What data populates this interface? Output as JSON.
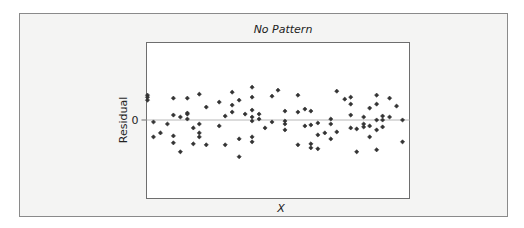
{
  "chart_data": {
    "type": "scatter",
    "title": "No Pattern",
    "xlabel": "X",
    "ylabel": "Residual",
    "y_ticks": [
      {
        "value": 0,
        "label": "0"
      }
    ],
    "x_ticks": [],
    "xlim": [
      0,
      26.4
    ],
    "ylim": [
      -7.9,
      7.8
    ],
    "reference_line": {
      "y": 0,
      "color": "#b8b8b8"
    },
    "grid": false,
    "legend": "none",
    "colors": {
      "point": "#333333",
      "frame_bg": "#f4f4f3",
      "plot_bg": "#ffffff",
      "border": "#707070"
    },
    "points": [
      [
        0.1,
        2.5
      ],
      [
        0.1,
        2.3
      ],
      [
        0.1,
        2.0
      ],
      [
        0.7,
        -0.2
      ],
      [
        0.7,
        -1.7
      ],
      [
        1.4,
        -1.3
      ],
      [
        2.1,
        -0.4
      ],
      [
        2.7,
        2.2
      ],
      [
        2.7,
        0.5
      ],
      [
        2.7,
        -1.6
      ],
      [
        2.7,
        -2.3
      ],
      [
        3.4,
        0.3
      ],
      [
        3.4,
        -3.2
      ],
      [
        4.1,
        2.2
      ],
      [
        4.1,
        0.7
      ],
      [
        4.1,
        0.6
      ],
      [
        4.1,
        0.1
      ],
      [
        4.7,
        -0.8
      ],
      [
        4.7,
        -2.4
      ],
      [
        5.3,
        2.6
      ],
      [
        5.3,
        -0.4
      ],
      [
        5.3,
        -1.3
      ],
      [
        5.3,
        -1.7
      ],
      [
        6.0,
        1.3
      ],
      [
        6.0,
        -2.5
      ],
      [
        7.3,
        1.8
      ],
      [
        7.3,
        -0.6
      ],
      [
        7.9,
        0.4
      ],
      [
        7.9,
        -2.5
      ],
      [
        8.6,
        2.8
      ],
      [
        8.6,
        1.5
      ],
      [
        8.6,
        0.8
      ],
      [
        9.3,
        2.0
      ],
      [
        9.3,
        -1.9
      ],
      [
        9.3,
        -3.7
      ],
      [
        9.9,
        0.6
      ],
      [
        10.6,
        3.3
      ],
      [
        10.6,
        2.3
      ],
      [
        10.6,
        1.0
      ],
      [
        10.6,
        0.3
      ],
      [
        10.6,
        -0.1
      ],
      [
        10.6,
        -1.7
      ],
      [
        10.6,
        -2.2
      ],
      [
        11.3,
        0.6
      ],
      [
        11.3,
        0.1
      ],
      [
        11.9,
        -0.8
      ],
      [
        12.6,
        2.4
      ],
      [
        12.6,
        -0.2
      ],
      [
        13.2,
        3.0
      ],
      [
        13.9,
        0.9
      ],
      [
        13.9,
        -0.1
      ],
      [
        13.9,
        -0.4
      ],
      [
        13.9,
        -1.0
      ],
      [
        15.2,
        2.5
      ],
      [
        15.2,
        0.8
      ],
      [
        15.2,
        -2.5
      ],
      [
        15.9,
        1.1
      ],
      [
        15.9,
        -0.6
      ],
      [
        16.5,
        0.9
      ],
      [
        16.5,
        -0.5
      ],
      [
        16.5,
        -2.4
      ],
      [
        16.5,
        -2.8
      ],
      [
        17.2,
        -0.3
      ],
      [
        17.2,
        -1.5
      ],
      [
        17.2,
        -2.9
      ],
      [
        17.9,
        -1.3
      ],
      [
        18.5,
        0.1
      ],
      [
        18.5,
        -0.4
      ],
      [
        18.5,
        -1.9
      ],
      [
        19.1,
        2.9
      ],
      [
        19.1,
        -1.2
      ],
      [
        19.9,
        2.1
      ],
      [
        20.5,
        2.3
      ],
      [
        20.5,
        1.6
      ],
      [
        20.5,
        0.5
      ],
      [
        20.5,
        -0.8
      ],
      [
        21.1,
        -0.9
      ],
      [
        21.1,
        -3.2
      ],
      [
        21.8,
        0.3
      ],
      [
        21.8,
        -0.4
      ],
      [
        21.8,
        -0.7
      ],
      [
        22.4,
        1.2
      ],
      [
        22.4,
        -0.6
      ],
      [
        22.4,
        -1.7
      ],
      [
        23.1,
        2.5
      ],
      [
        23.1,
        1.6
      ],
      [
        23.1,
        0.0
      ],
      [
        23.1,
        -1.0
      ],
      [
        23.1,
        -3.0
      ],
      [
        23.7,
        0.4
      ],
      [
        23.7,
        0.0
      ],
      [
        23.7,
        -0.7
      ],
      [
        24.4,
        2.2
      ],
      [
        24.4,
        0.3
      ],
      [
        25.1,
        1.4
      ],
      [
        25.7,
        0.0
      ],
      [
        25.7,
        -2.2
      ]
    ]
  }
}
